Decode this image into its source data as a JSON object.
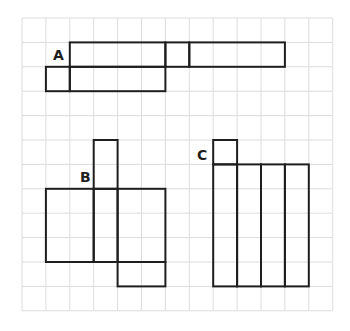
{
  "grid": {
    "origin_x": 22,
    "origin_y": 18,
    "cell_w": 23.9,
    "cell_h": 24.4,
    "cols": 13,
    "rows": 12,
    "line_color": "#dcdcdc"
  },
  "shapes": [
    {
      "label": "A",
      "label_pos": [
        53,
        60
      ],
      "rects_cells": [
        {
          "c": 2,
          "r": 1,
          "w": 4,
          "h": 1
        },
        {
          "c": 6,
          "r": 1,
          "w": 1,
          "h": 1
        },
        {
          "c": 7,
          "r": 1,
          "w": 4,
          "h": 1
        },
        {
          "c": 1,
          "r": 2,
          "w": 1,
          "h": 1
        },
        {
          "c": 2,
          "r": 2,
          "w": 4,
          "h": 1
        }
      ]
    },
    {
      "label": "B",
      "label_pos": [
        80,
        182
      ],
      "rects_cells": [
        {
          "c": 3,
          "r": 5,
          "w": 1,
          "h": 2
        },
        {
          "c": 1,
          "r": 7,
          "w": 2,
          "h": 3
        },
        {
          "c": 3,
          "r": 7,
          "w": 1,
          "h": 3
        },
        {
          "c": 4,
          "r": 7,
          "w": 2,
          "h": 3
        },
        {
          "c": 4,
          "r": 10,
          "w": 2,
          "h": 1
        }
      ]
    },
    {
      "label": "C",
      "label_pos": [
        197,
        160
      ],
      "rects_cells": [
        {
          "c": 8,
          "r": 5,
          "w": 1,
          "h": 1
        },
        {
          "c": 8,
          "r": 6,
          "w": 1,
          "h": 5
        },
        {
          "c": 9,
          "r": 6,
          "w": 1,
          "h": 5
        },
        {
          "c": 10,
          "r": 6,
          "w": 1,
          "h": 5
        },
        {
          "c": 11,
          "r": 6,
          "w": 1,
          "h": 5
        }
      ]
    }
  ],
  "line_color": "#1e1e1e"
}
